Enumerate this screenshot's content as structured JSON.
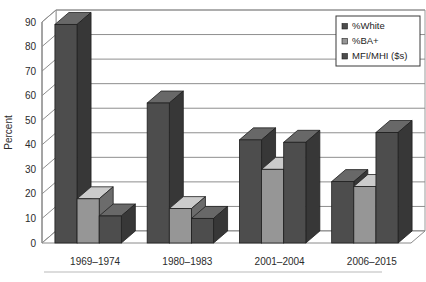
{
  "chart_data": {
    "type": "bar",
    "title": "",
    "subtitle": "",
    "xlabel": "",
    "ylabel": "Percent",
    "ylim": [
      0,
      90
    ],
    "ytick_step": 10,
    "yticks": [
      "0",
      "10",
      "20",
      "30",
      "40",
      "50",
      "60",
      "70",
      "80",
      "90"
    ],
    "grid": true,
    "legend_position": "top-right",
    "style": "3d-clustered-column",
    "categories": [
      "1969–1974",
      "1980–1983",
      "2001–2004",
      "2006–2015"
    ],
    "series": [
      {
        "name": "%White",
        "values": [
          89,
          57,
          42,
          25
        ],
        "color": "#4d4d4d"
      },
      {
        "name": "%BA+",
        "values": [
          18,
          14,
          30,
          23
        ],
        "color": "#969696"
      },
      {
        "name": "MFI/MHI ($s)",
        "values": [
          11,
          10,
          41,
          45
        ],
        "color": "#4d4d4d"
      }
    ]
  },
  "legend": {
    "items": [
      {
        "label": "%White",
        "swatch": "#4d4d4d"
      },
      {
        "label": "%BA+",
        "swatch": "#969696"
      },
      {
        "label": "MFI/MHI ($s)",
        "swatch": "#4d4d4d"
      }
    ]
  },
  "axes": {
    "y_title": "Percent",
    "y_ticks": [
      "90",
      "80",
      "70",
      "60",
      "50",
      "40",
      "30",
      "20",
      "10",
      "0"
    ],
    "x_categories": [
      "1969–1974",
      "1980–1983",
      "2001–2004",
      "2006–2015"
    ]
  },
  "colors": {
    "series_dark": "#4d4d4d",
    "series_light": "#969696",
    "grid": "#8e8e8e",
    "axis": "#8a8a8a",
    "text": "#2b2b2b",
    "background": "#ffffff"
  }
}
